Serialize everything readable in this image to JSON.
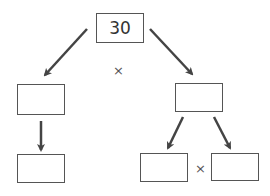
{
  "diagram": {
    "type": "factor-tree",
    "root": {
      "value": "30"
    },
    "operators": {
      "top_times": "×",
      "bottom_times": "×"
    },
    "nodes": {
      "left_mid": {
        "value": ""
      },
      "right_mid": {
        "value": ""
      },
      "left_bottom": {
        "value": ""
      },
      "bottom_middle": {
        "value": ""
      },
      "bottom_right": {
        "value": ""
      }
    },
    "colors": {
      "stroke": "#555555",
      "arrow": "#444444",
      "text": "#333333"
    }
  }
}
